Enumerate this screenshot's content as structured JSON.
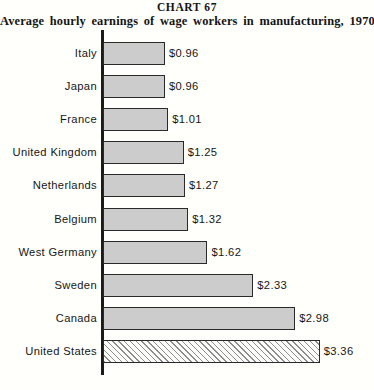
{
  "header": {
    "chart_number": "CHART 67",
    "subtitle": "Average hourly earnings of wage workers in manufacturing, 1970"
  },
  "chart_data": {
    "type": "bar",
    "orientation": "horizontal",
    "title": "CHART 67",
    "subtitle": "Average hourly earnings of wage workers in manufacturing, 1970",
    "xlabel": "",
    "ylabel": "",
    "xlim": [
      0,
      3.36
    ],
    "grid": false,
    "legend": false,
    "value_prefix": "$",
    "categories": [
      "Italy",
      "Japan",
      "France",
      "United Kingdom",
      "Netherlands",
      "Belgium",
      "West Germany",
      "Sweden",
      "Canada",
      "United States"
    ],
    "values": [
      0.96,
      0.96,
      1.01,
      1.25,
      1.27,
      1.32,
      1.62,
      2.33,
      2.98,
      3.36
    ],
    "value_labels": [
      "$0.96",
      "$0.96",
      "$1.01",
      "$1.25",
      "$1.27",
      "$1.32",
      "$1.62",
      "$2.33",
      "$2.98",
      "$3.36"
    ],
    "bar_styles": [
      "solid-gray",
      "solid-gray",
      "solid-gray",
      "solid-gray",
      "solid-gray",
      "solid-gray",
      "solid-gray",
      "solid-gray",
      "solid-gray",
      "diagonal-hatch"
    ],
    "colors": {
      "bar_fill": "#cccccc",
      "bar_border": "#2a2a2a",
      "highlight_fill": "#fdfdfa",
      "hatch_stroke": "#8d8d8d",
      "axis": "#1b1b1b",
      "text": "#161616",
      "background": "#fffffc"
    }
  }
}
